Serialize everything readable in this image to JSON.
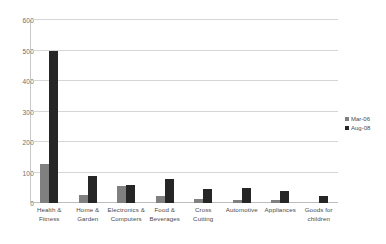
{
  "chart_data": {
    "type": "bar",
    "title": "",
    "xlabel": "",
    "ylabel": "",
    "ylim": [
      0,
      600
    ],
    "yticks": [
      0,
      100,
      200,
      300,
      400,
      500,
      600
    ],
    "grid": true,
    "legend_position": "right",
    "categories": [
      "Health & Fitness",
      "Home & Garden",
      "Electronics & Computers",
      "Food & Beverages",
      "Cross Cutting",
      "Automotive",
      "Appliances",
      "Goods for children"
    ],
    "category_lines": [
      [
        "Health &",
        "Fitness"
      ],
      [
        "Home &",
        "Garden"
      ],
      [
        "Electronics &",
        "Computers"
      ],
      [
        "Food &",
        "Beverages"
      ],
      [
        "Cross",
        "Cutting"
      ],
      [
        "Automotive",
        ""
      ],
      [
        "Appliances",
        ""
      ],
      [
        "Goods for",
        "children"
      ]
    ],
    "series": [
      {
        "name": "Mar-06",
        "color": "#808080",
        "values": [
          128,
          25,
          55,
          22,
          12,
          10,
          10,
          0
        ]
      },
      {
        "name": "Aug-08",
        "color": "#262626",
        "values": [
          500,
          88,
          60,
          80,
          45,
          48,
          38,
          22
        ]
      }
    ]
  }
}
